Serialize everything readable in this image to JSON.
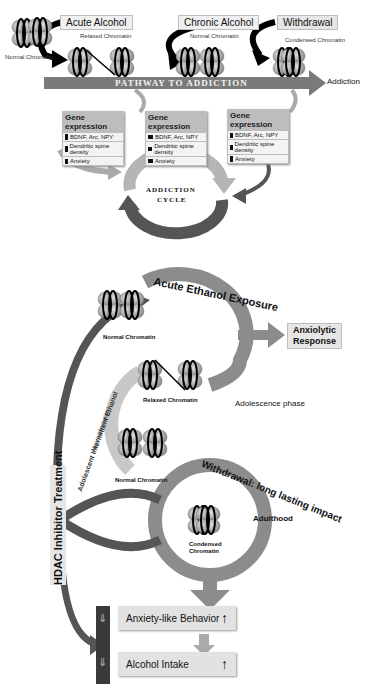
{
  "top_panel": {
    "stages": [
      {
        "label": "Acute Alcohol",
        "chromatin": "Relaxed Chromatin"
      },
      {
        "label": "Chronic Alcohol",
        "chromatin": "Normal Chromatin"
      },
      {
        "label": "Withdrawal",
        "chromatin": "Condensed Chromatin"
      }
    ],
    "initial_chromatin": "Normal Chromatin",
    "pathway_label": "PATHWAY TO ADDICTION",
    "pathway_end": "Addiction",
    "gene_expression_boxes": [
      {
        "title": "Gene expression",
        "rows": [
          {
            "indicator": "up",
            "text": "BDNF, Arc, NPY"
          },
          {
            "indicator": "up",
            "text": "Dendritic spine density"
          },
          {
            "indicator": "down",
            "text": "Anxiety"
          }
        ]
      },
      {
        "title": "Gene expression",
        "rows": [
          {
            "indicator": "equal",
            "text": "BDNF, Arc, NPY"
          },
          {
            "indicator": "equal",
            "text": "Dendritic spine density"
          },
          {
            "indicator": "equal",
            "text": "Anxiety"
          }
        ]
      },
      {
        "title": "Gene expression",
        "rows": [
          {
            "indicator": "down",
            "text": "BDNF, Arc, NPY"
          },
          {
            "indicator": "down",
            "text": "Dendritic spine density"
          },
          {
            "indicator": "up",
            "text": "Anxiety"
          }
        ]
      }
    ],
    "cycle_label_line1": "ADDICTION",
    "cycle_label_line2": "CYCLE"
  },
  "bottom_panel": {
    "acute_exposure": "Acute Ethanol Exposure",
    "anxiolytic_line1": "Anxiolytic",
    "anxiolytic_line2": "Response",
    "normal_chromatin_1": "Normal Chromatin",
    "relaxed_chromatin": "Relaxed Chromatin",
    "adolescence_phase": "Adolescence phase",
    "intermittent_line1": "Adolescent Intermittent Ethanol",
    "intermittent_line2": "Neuroadaptation",
    "normal_chromatin_2": "Normal Chromatin",
    "withdrawal_arc": "Withdrawal: long lasting impact",
    "condensed_line1": "Condensed",
    "condensed_line2": "Chromatin",
    "adulthood": "Adulthood",
    "hdac_treatment": "HDAC Inhibitor Treatment",
    "outcomes": [
      {
        "label": "Anxiety-like Behavior",
        "direction": "up"
      },
      {
        "label": "Alcohol Intake",
        "direction": "up"
      }
    ],
    "histone_marks": {
      "acetyl": "Ac",
      "methyl": "Me"
    }
  },
  "colors": {
    "dark_gray": "#555555",
    "mid_gray": "#8c8c8c",
    "light_gray": "#b5b5b5",
    "box_gray": "#e2e2e2"
  }
}
